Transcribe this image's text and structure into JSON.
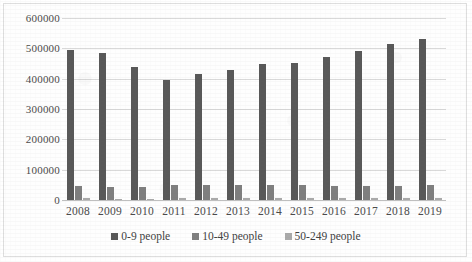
{
  "chart_data": {
    "type": "bar",
    "title": "",
    "subtitle": "",
    "xlabel": "",
    "ylabel": "",
    "categories": [
      "2008",
      "2009",
      "2010",
      "2011",
      "2012",
      "2013",
      "2014",
      "2015",
      "2016",
      "2017",
      "2018",
      "2019"
    ],
    "series": [
      {
        "name": "0-9 people",
        "color": "#585858",
        "values": [
          494000,
          486000,
          437000,
          395000,
          414000,
          427000,
          450000,
          453000,
          470000,
          491000,
          514000,
          532000
        ]
      },
      {
        "name": "10-49 people",
        "color": "#7f7f7f",
        "values": [
          47000,
          44000,
          44000,
          48000,
          48000,
          48000,
          48000,
          48000,
          47000,
          47000,
          47000,
          50000
        ]
      },
      {
        "name": "50-249 people",
        "color": "#aaaaaa",
        "values": [
          5200,
          4800,
          4800,
          5200,
          5200,
          5200,
          5300,
          5300,
          5300,
          5300,
          5400,
          5500
        ]
      }
    ],
    "ylim": [
      0,
      600000
    ],
    "ytick_step": 100000,
    "yticks": [
      "600000",
      "500000",
      "400000",
      "300000",
      "200000",
      "100000",
      "0"
    ],
    "grid": "horizontal",
    "legend_position": "bottom"
  },
  "legend": {
    "items": [
      {
        "label": "0-9 people"
      },
      {
        "label": "10-49 people"
      },
      {
        "label": "50-249 people"
      }
    ]
  }
}
